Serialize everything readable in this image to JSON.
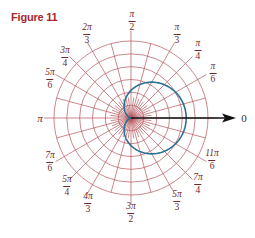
{
  "figure": {
    "title": "Figure 11"
  },
  "colors": {
    "title": "#a8272e",
    "grid": "#b4545a",
    "curve": "#2a6f94",
    "axis": "#111111",
    "labels": "#6b2a2e"
  },
  "chart_data": {
    "type": "line",
    "title": "Figure 11",
    "coordinate_system": "polar",
    "polar_axis": {
      "label": "0",
      "direction": "right",
      "arrow": true
    },
    "grid": {
      "circles": 6,
      "radial_lines_every": "π/12 (denser near pole)",
      "on": true
    },
    "angle_labels": [
      {
        "angle": "0",
        "num": "",
        "den": "",
        "text": "0"
      },
      {
        "angle": "π/6",
        "num": "π",
        "den": "6"
      },
      {
        "angle": "π/4",
        "num": "π",
        "den": "4"
      },
      {
        "angle": "π/3",
        "num": "π",
        "den": "3"
      },
      {
        "angle": "π/2",
        "num": "π",
        "den": "2"
      },
      {
        "angle": "2π/3",
        "num": "2π",
        "den": "3"
      },
      {
        "angle": "3π/4",
        "num": "3π",
        "den": "4"
      },
      {
        "angle": "5π/6",
        "num": "5π",
        "den": "6"
      },
      {
        "angle": "π",
        "text": "π"
      },
      {
        "angle": "7π/6",
        "num": "7π",
        "den": "6"
      },
      {
        "angle": "5π/4",
        "num": "5π",
        "den": "4"
      },
      {
        "angle": "4π/3",
        "num": "4π",
        "den": "3"
      },
      {
        "angle": "3π/2",
        "num": "3π",
        "den": "2"
      },
      {
        "angle": "5π/3",
        "num": "5π",
        "den": "3"
      },
      {
        "angle": "7π/4",
        "num": "7π",
        "den": "4"
      },
      {
        "angle": "11π/6",
        "num": "11π",
        "den": "6"
      }
    ],
    "series": [
      {
        "name": "cardioid",
        "equation_shape": "r = a(1 + cos θ)",
        "a_in_grid_units": 2.15,
        "r_at_0": 4.3,
        "r_at_pi_over_2": 2.15,
        "r_at_pi": 0
      }
    ],
    "rlim": [
      0,
      6
    ]
  },
  "labels": {
    "l0": "0",
    "pi": "π",
    "l_pi6": {
      "num": "π",
      "den": "6"
    },
    "l_pi4": {
      "num": "π",
      "den": "4"
    },
    "l_pi3": {
      "num": "π",
      "den": "3"
    },
    "l_pi2": {
      "num": "π",
      "den": "2"
    },
    "l_2pi3": {
      "num": "2π",
      "den": "3"
    },
    "l_3pi4": {
      "num": "3π",
      "den": "4"
    },
    "l_5pi6": {
      "num": "5π",
      "den": "6"
    },
    "l_7pi6": {
      "num": "7π",
      "den": "6"
    },
    "l_5pi4": {
      "num": "5π",
      "den": "4"
    },
    "l_4pi3": {
      "num": "4π",
      "den": "3"
    },
    "l_3pi2": {
      "num": "3π",
      "den": "2"
    },
    "l_5pi3": {
      "num": "5π",
      "den": "3"
    },
    "l_7pi4": {
      "num": "7π",
      "den": "4"
    },
    "l_11pi6": {
      "num": "11π",
      "den": "6"
    }
  }
}
